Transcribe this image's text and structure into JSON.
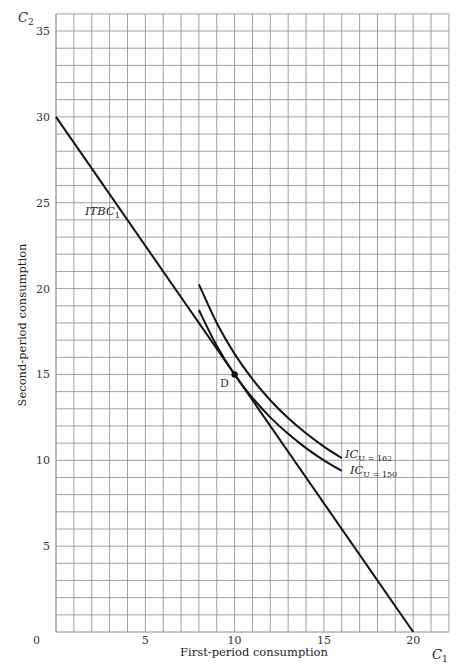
{
  "chart_data": {
    "type": "line",
    "title": "",
    "xlabel": "First-period consumption",
    "ylabel": "Second-period consumption",
    "x_axis_symbol": "C1",
    "y_axis_symbol": "C2",
    "xlim": [
      0,
      22
    ],
    "ylim": [
      0,
      36
    ],
    "x_ticks": [
      0,
      5,
      10,
      15,
      20
    ],
    "y_ticks": [
      5,
      10,
      15,
      20,
      25,
      30,
      35
    ],
    "grid": true,
    "grid_step": 1,
    "series": [
      {
        "name": "ITBC1",
        "label": "ITBC",
        "label_sub": "1",
        "kind": "budget-line",
        "points": [
          [
            0,
            30
          ],
          [
            20,
            0
          ]
        ]
      },
      {
        "name": "IC U=162",
        "label": "IC",
        "label_sub": "U = 162",
        "kind": "indifference-curve",
        "points": [
          [
            8,
            20.25
          ],
          [
            9,
            18
          ],
          [
            10,
            16.2
          ],
          [
            11,
            14.73
          ],
          [
            12,
            13.5
          ],
          [
            13,
            12.46
          ],
          [
            14,
            11.57
          ],
          [
            15,
            10.8
          ],
          [
            16,
            10.13
          ]
        ]
      },
      {
        "name": "IC U=150",
        "label": "IC",
        "label_sub": "U = 150",
        "kind": "indifference-curve",
        "points": [
          [
            8,
            18.75
          ],
          [
            9,
            16.67
          ],
          [
            10,
            15
          ],
          [
            11,
            13.64
          ],
          [
            12,
            12.5
          ],
          [
            13,
            11.54
          ],
          [
            14,
            10.71
          ],
          [
            15,
            10
          ],
          [
            16,
            9.38
          ]
        ]
      }
    ],
    "annotations": [
      {
        "label": "D",
        "x": 10,
        "y": 15,
        "marker": "dot"
      }
    ]
  },
  "labels": {
    "y_symbol": "C",
    "y_symbol_sub": "2",
    "x_symbol": "C",
    "x_symbol_sub": "1",
    "xlabel": "First-period consumption",
    "ylabel": "Second-period consumption",
    "zero": "0",
    "itbc": "ITBC",
    "itbc_sub": "1",
    "ic": "IC",
    "ic162_sub": "U = 162",
    "ic150_sub": "U = 150",
    "point_d": "D"
  }
}
